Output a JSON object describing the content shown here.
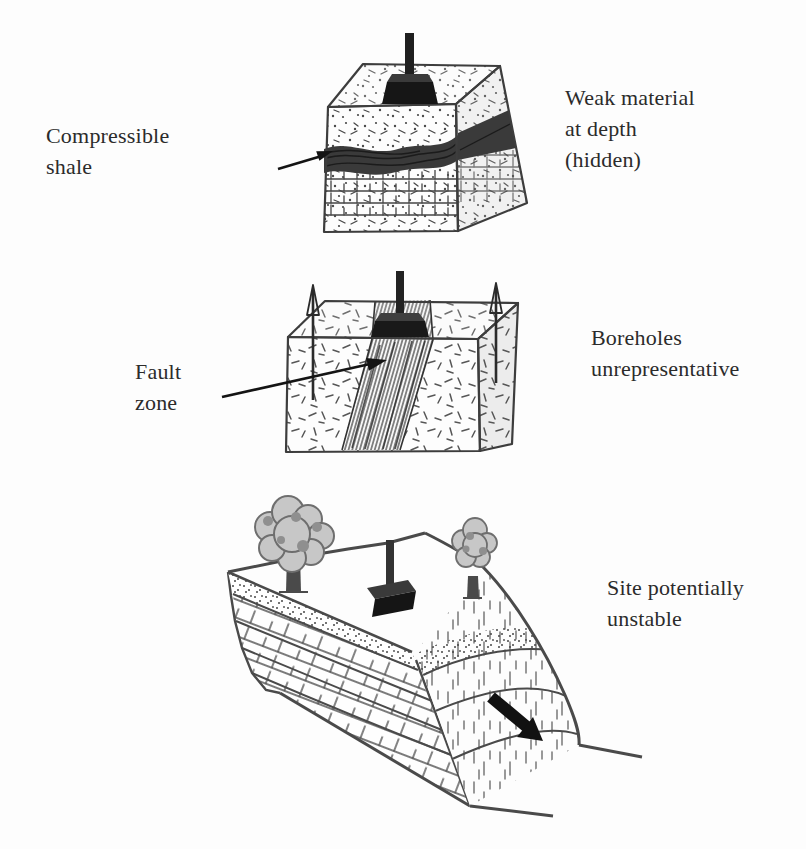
{
  "figure": {
    "type": "geology-site-investigation-diagram",
    "background_color": "#fdfdfd",
    "ink_color": "#2b2b2b",
    "panels": [
      {
        "id": "compressible-shale-block",
        "caption_left": "Compressible\nshale",
        "caption_right": "Weak material\nat depth\n(hidden)"
      },
      {
        "id": "fault-zone-block",
        "caption_left": "Fault\nzone",
        "caption_right": "Boreholes\nunrepresentative"
      },
      {
        "id": "unstable-slope-hillside",
        "caption_right": "Site potentially\nunstable"
      }
    ],
    "icons": {
      "drill_rig": "borehole-rig-icon",
      "label_arrow": "label-arrow-icon",
      "borehole_arrow": "borehole-arrow-icon",
      "slide_arrow": "slide-direction-arrow-icon",
      "tree": "tree-icon"
    }
  }
}
